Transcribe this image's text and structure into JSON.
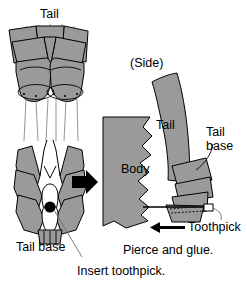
{
  "figure": {
    "width": 247,
    "height": 285,
    "background": "#ffffff",
    "fill_gray": "#9a9a9a",
    "line_color": "#000000",
    "thin_line_color": "#555555"
  },
  "labels": {
    "tail_top": "Tail",
    "side_view": "(Side)",
    "tail_side": "Tail",
    "body": "Body",
    "tail_base_right": "Tail\nbase",
    "tail_base_right_line1": "Tail",
    "tail_base_right_line2": "base",
    "toothpick": "Toothpick",
    "tail_base_left": "Tail base",
    "pierce_and_glue": "Pierce and glue.",
    "insert_toothpick": "Insert toothpick."
  },
  "icons": {
    "process_arrow": "right-arrow-icon",
    "direction_arrow": "left-arrow-icon",
    "pierce_point": "black-dot-icon",
    "leader_tail_base": "leader-line-icon",
    "leader_insert": "leader-line-icon"
  }
}
